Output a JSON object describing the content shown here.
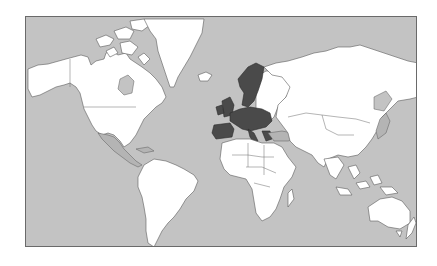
{
  "map": {
    "projection": "Mercator",
    "title": "World map highlighting European Union member states",
    "colors": {
      "ocean": "#c3c3c3",
      "land": "#ffffff",
      "highlighted": "#4a4a4a",
      "secondary_land": "#b4b4b4",
      "border": "#5a5a5a",
      "frame": "#6a6a6a"
    },
    "legend": null,
    "regions": [
      {
        "name": "North America",
        "fill": "land"
      },
      {
        "name": "Greenland",
        "fill": "land"
      },
      {
        "name": "South America",
        "fill": "land"
      },
      {
        "name": "Europe (EU member states)",
        "fill": "highlighted"
      },
      {
        "name": "Russia and Asia",
        "fill": "land"
      },
      {
        "name": "Africa",
        "fill": "land"
      },
      {
        "name": "Australia",
        "fill": "land"
      },
      {
        "name": "Mexico / Central America",
        "fill": "secondary_land"
      },
      {
        "name": "Turkey / Caucasus",
        "fill": "secondary_land"
      },
      {
        "name": "Japan",
        "fill": "secondary_land"
      }
    ]
  }
}
